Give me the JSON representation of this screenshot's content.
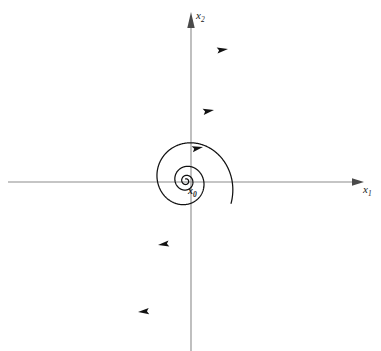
{
  "figure": {
    "type": "phase-portrait",
    "title": "",
    "background_color": "#ffffff"
  },
  "axes": {
    "x_axis": {
      "label": "x",
      "subscript": "1",
      "color": "#8b8b8b",
      "orientation": "horizontal",
      "arrow": "right",
      "start_px": 8,
      "end_px": 364,
      "y_px": 182
    },
    "y_axis": {
      "label": "x",
      "subscript": "2",
      "color": "#8b8b8b",
      "orientation": "vertical",
      "arrow": "up",
      "start_px": 12,
      "end_px": 351,
      "x_px": 191
    },
    "origin": {
      "x_px": 191,
      "y_px": 182
    }
  },
  "annotations": {
    "initial_point": {
      "label": "x",
      "subscript": "0",
      "x_px": 188,
      "y_px": 186
    }
  },
  "chart_data": {
    "type": "line",
    "title": "",
    "xlabel": "x1",
    "ylabel": "x2",
    "legend": [],
    "grid": false,
    "curve_color": "#121212",
    "spiral": {
      "kind": "unstable-focus",
      "direction": "clockwise",
      "center": {
        "x": 186,
        "y": 181
      },
      "ellipse_ratio_y_over_x": 1.05,
      "tilt_deg": -18,
      "growth_per_turn": 2.6,
      "start_radius_px": 2.0,
      "turns": 3.35
    },
    "flow_arrows": [
      {
        "x_px": 228,
        "y_px": 49,
        "angle_deg": -8,
        "note": "outer loop, top"
      },
      {
        "x_px": 214,
        "y_px": 110,
        "angle_deg": -10,
        "note": "middle loop, top"
      },
      {
        "x_px": 203,
        "y_px": 147,
        "angle_deg": -12,
        "note": "inner loop, top"
      },
      {
        "x_px": 158,
        "y_px": 245,
        "angle_deg": 172,
        "note": "middle loop, bottom"
      },
      {
        "x_px": 138,
        "y_px": 312,
        "angle_deg": 175,
        "note": "outer loop, bottom"
      }
    ]
  }
}
